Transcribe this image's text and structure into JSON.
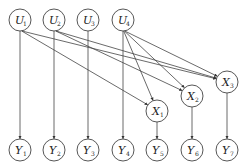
{
  "diagram": {
    "type": "directed-graph",
    "node_radius": 11,
    "nodes": [
      {
        "id": "U1",
        "base": "U",
        "sub": "1",
        "x": 20,
        "y": 20
      },
      {
        "id": "U2",
        "base": "U",
        "sub": "2",
        "x": 54,
        "y": 20
      },
      {
        "id": "U3",
        "base": "U",
        "sub": "3",
        "x": 88,
        "y": 20
      },
      {
        "id": "U4",
        "base": "U",
        "sub": "4",
        "x": 123,
        "y": 20
      },
      {
        "id": "X1",
        "base": "X",
        "sub": "1",
        "x": 157,
        "y": 111
      },
      {
        "id": "X2",
        "base": "X",
        "sub": "2",
        "x": 192,
        "y": 96
      },
      {
        "id": "X3",
        "base": "X",
        "sub": "3",
        "x": 227,
        "y": 82
      },
      {
        "id": "Y1",
        "base": "Y",
        "sub": "1",
        "x": 20,
        "y": 150
      },
      {
        "id": "Y2",
        "base": "Y",
        "sub": "2",
        "x": 54,
        "y": 150
      },
      {
        "id": "Y3",
        "base": "Y",
        "sub": "3",
        "x": 88,
        "y": 150
      },
      {
        "id": "Y4",
        "base": "Y",
        "sub": "4",
        "x": 123,
        "y": 150
      },
      {
        "id": "Y5",
        "base": "Y",
        "sub": "5",
        "x": 157,
        "y": 150
      },
      {
        "id": "Y6",
        "base": "Y",
        "sub": "6",
        "x": 192,
        "y": 150
      },
      {
        "id": "Y7",
        "base": "Y",
        "sub": "7",
        "x": 227,
        "y": 150
      }
    ],
    "edges": [
      [
        "U1",
        "Y1"
      ],
      [
        "U2",
        "Y2"
      ],
      [
        "U3",
        "Y3"
      ],
      [
        "U4",
        "Y4"
      ],
      [
        "X1",
        "Y5"
      ],
      [
        "X2",
        "Y6"
      ],
      [
        "X3",
        "Y7"
      ],
      [
        "U1",
        "X1"
      ],
      [
        "U1",
        "X3"
      ],
      [
        "U2",
        "X2"
      ],
      [
        "U2",
        "X3"
      ],
      [
        "U4",
        "X1"
      ],
      [
        "U4",
        "X2"
      ],
      [
        "U4",
        "X3"
      ]
    ]
  }
}
